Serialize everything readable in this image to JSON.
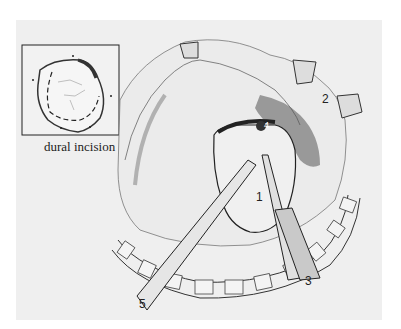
{
  "figure": {
    "type": "surgical illustration",
    "inset": {
      "caption": "dural incision"
    },
    "labels": [
      {
        "id": "1",
        "text": "1"
      },
      {
        "id": "2",
        "text": "2"
      },
      {
        "id": "3",
        "text": "3"
      },
      {
        "id": "4",
        "text": "4"
      },
      {
        "id": "5",
        "text": "5"
      }
    ]
  },
  "colors": {
    "background": "#efefef",
    "line": "#2a2a2a",
    "shade": "#555555"
  }
}
